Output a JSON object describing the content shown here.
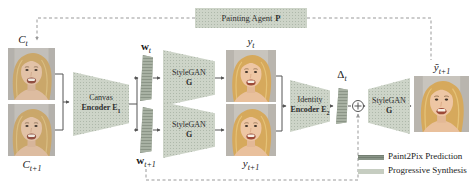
{
  "palette": {
    "node_fill": "#cdd4c8",
    "node_stipple": "#aeb8aa",
    "bar_fill": "#a8b1a3",
    "bar_hatch": "#788274",
    "legend_dark": "#8a9588",
    "legend_light": "#c6cdc1",
    "arrow": "#555555",
    "dashed_line": "#999999",
    "text": "#1a1a1a"
  },
  "agent": {
    "label": "Painting Agent",
    "bold": "P"
  },
  "labels": {
    "ct": {
      "base": "C",
      "sub": "t"
    },
    "ct1": {
      "base": "C",
      "sub": "t+1"
    },
    "wt": {
      "base": "w",
      "sub": "t"
    },
    "wt1": {
      "base": "w",
      "sub": "t+1"
    },
    "yt": {
      "base": "y",
      "sub": "t"
    },
    "yt1": {
      "base": "y",
      "sub": "t+1"
    },
    "delta": {
      "base": "Δ",
      "sub": "t"
    },
    "yhat": {
      "base": "ỹ",
      "sub": "t+1"
    }
  },
  "nodes": {
    "canvas_encoder": {
      "line1": "Canvas",
      "line2": "Encoder E",
      "sub": "1"
    },
    "stylegan_top": {
      "line1": "StyleGAN",
      "line2": "G"
    },
    "stylegan_bottom": {
      "line1": "StyleGAN",
      "line2": "G"
    },
    "identity_encoder": {
      "line1": "Identity",
      "line2": "Encoder E",
      "sub": "2"
    },
    "stylegan_final": {
      "line1": "StyleGAN",
      "line2": "G"
    }
  },
  "legend": {
    "items": [
      {
        "label": "Paint2Pix Prediction",
        "swatch": "dark"
      },
      {
        "label": "Progressive Synthesis",
        "swatch": "light"
      }
    ]
  }
}
